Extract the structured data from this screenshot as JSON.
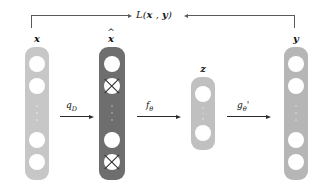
{
  "figure": {
    "type": "neural-network-architecture-diagram",
    "background": "#ffffff",
    "loss": {
      "label_prefix": "L(",
      "label_x": "x",
      "label_sep": " , ",
      "label_y": "y",
      "label_suffix": ")",
      "full_label": "L(x , y)",
      "bracket_color": "#5a5a5a",
      "description": "loss bracket connecting input x and output y"
    },
    "blocks": [
      {
        "id": "input",
        "caption": "x",
        "caption_hat": false,
        "fill": "#c7c7c7",
        "node_fill": "#ffffff",
        "dots_color": "#dcdcdc",
        "nodes": [
          "open",
          "open",
          "open",
          "open"
        ],
        "has_ellipsis": true
      },
      {
        "id": "corrupted",
        "caption": "x",
        "caption_hat": true,
        "fill": "#6e6e6e",
        "node_fill": "#ffffff",
        "dots_color": "#9a9a9a",
        "nodes": [
          "open",
          "crossed",
          "open",
          "crossed"
        ],
        "has_ellipsis": true
      },
      {
        "id": "latent",
        "caption": "z",
        "caption_hat": false,
        "fill": "#c0c0c0",
        "node_fill": "#ffffff",
        "dots_color": "#d4d4d4",
        "nodes": [
          "open",
          "open"
        ],
        "has_ellipsis": true
      },
      {
        "id": "output",
        "caption": "y",
        "caption_hat": false,
        "fill": "#b6b6b6",
        "node_fill": "#ffffff",
        "dots_color": "#cccccc",
        "nodes": [
          "open",
          "open",
          "open",
          "open"
        ],
        "has_ellipsis": true
      }
    ],
    "arrows": [
      {
        "id": "corruption",
        "label_base": "q",
        "label_sub": "D",
        "label_prime": ""
      },
      {
        "id": "encoder",
        "label_base": "f",
        "label_sub": "θ",
        "label_prime": ""
      },
      {
        "id": "decoder",
        "label_base": "g",
        "label_sub": "θ",
        "label_prime": "'"
      }
    ]
  }
}
